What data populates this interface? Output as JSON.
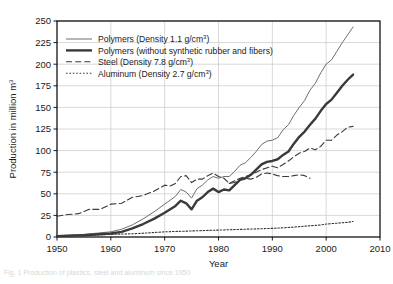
{
  "figure": {
    "caption": "Fig. 1  Production of plastics, steel and aluminum since 1950"
  },
  "chart_data": {
    "type": "line",
    "title": "",
    "xlabel": "Year",
    "ylabel": "Production in million m³",
    "xlim": [
      1950,
      2010
    ],
    "ylim": [
      0,
      250
    ],
    "xticks": [
      1950,
      1960,
      1970,
      1980,
      1990,
      2000,
      2010
    ],
    "yticks": [
      0,
      25,
      50,
      75,
      100,
      125,
      150,
      175,
      200,
      225,
      250
    ],
    "grid": "horizontal-and-vertical",
    "legend_position": "upper-left-inside",
    "series": [
      {
        "name": "Polymers (Density 1.1 g/cm³)",
        "style": "solid-thin",
        "color": "#6e6e6e",
        "width": 1.0,
        "points": [
          [
            1950,
            1.5
          ],
          [
            1955,
            3
          ],
          [
            1960,
            6
          ],
          [
            1962,
            9
          ],
          [
            1964,
            14
          ],
          [
            1966,
            21
          ],
          [
            1968,
            29
          ],
          [
            1970,
            38
          ],
          [
            1972,
            47
          ],
          [
            1973,
            55
          ],
          [
            1974,
            52
          ],
          [
            1975,
            45
          ],
          [
            1976,
            56
          ],
          [
            1977,
            60
          ],
          [
            1978,
            66
          ],
          [
            1979,
            70
          ],
          [
            1980,
            68
          ],
          [
            1981,
            70
          ],
          [
            1982,
            70
          ],
          [
            1983,
            76
          ],
          [
            1984,
            83
          ],
          [
            1985,
            86
          ],
          [
            1986,
            92
          ],
          [
            1987,
            99
          ],
          [
            1988,
            107
          ],
          [
            1989,
            111
          ],
          [
            1990,
            112
          ],
          [
            1991,
            115
          ],
          [
            1992,
            124
          ],
          [
            1993,
            130
          ],
          [
            1994,
            141
          ],
          [
            1995,
            150
          ],
          [
            1996,
            158
          ],
          [
            1997,
            170
          ],
          [
            1998,
            178
          ],
          [
            1999,
            190
          ],
          [
            2000,
            200
          ],
          [
            2001,
            205
          ],
          [
            2002,
            215
          ],
          [
            2003,
            225
          ],
          [
            2004,
            234
          ],
          [
            2005,
            243
          ]
        ]
      },
      {
        "name": "Polymers (without synthetic rubber and fibers)",
        "style": "solid-thick",
        "color": "#3a3a3a",
        "width": 2.4,
        "points": [
          [
            1950,
            1
          ],
          [
            1955,
            2
          ],
          [
            1960,
            4
          ],
          [
            1962,
            6
          ],
          [
            1964,
            10
          ],
          [
            1966,
            15
          ],
          [
            1968,
            21
          ],
          [
            1970,
            28
          ],
          [
            1972,
            36
          ],
          [
            1973,
            42
          ],
          [
            1974,
            39
          ],
          [
            1975,
            32
          ],
          [
            1976,
            42
          ],
          [
            1977,
            46
          ],
          [
            1978,
            52
          ],
          [
            1979,
            56
          ],
          [
            1980,
            52
          ],
          [
            1981,
            55
          ],
          [
            1982,
            54
          ],
          [
            1983,
            60
          ],
          [
            1984,
            66
          ],
          [
            1985,
            68
          ],
          [
            1986,
            72
          ],
          [
            1987,
            78
          ],
          [
            1988,
            84
          ],
          [
            1989,
            87
          ],
          [
            1990,
            88
          ],
          [
            1991,
            90
          ],
          [
            1992,
            95
          ],
          [
            1993,
            99
          ],
          [
            1994,
            108
          ],
          [
            1995,
            116
          ],
          [
            1996,
            122
          ],
          [
            1997,
            130
          ],
          [
            1998,
            137
          ],
          [
            1999,
            146
          ],
          [
            2000,
            154
          ],
          [
            2001,
            159
          ],
          [
            2002,
            167
          ],
          [
            2003,
            175
          ],
          [
            2004,
            182
          ],
          [
            2005,
            188
          ]
        ]
      },
      {
        "name": "Steel (Density 7.8 g/cm³)",
        "style": "dashed",
        "color": "#3a3a3a",
        "width": 1.1,
        "points": [
          [
            1950,
            24
          ],
          [
            1952,
            26
          ],
          [
            1954,
            27
          ],
          [
            1956,
            32
          ],
          [
            1958,
            32
          ],
          [
            1960,
            38
          ],
          [
            1962,
            39
          ],
          [
            1964,
            46
          ],
          [
            1966,
            48
          ],
          [
            1968,
            53
          ],
          [
            1970,
            60
          ],
          [
            1971,
            59
          ],
          [
            1972,
            62
          ],
          [
            1973,
            70
          ],
          [
            1974,
            71
          ],
          [
            1975,
            63
          ],
          [
            1976,
            67
          ],
          [
            1977,
            67
          ],
          [
            1978,
            71
          ],
          [
            1979,
            74
          ],
          [
            1980,
            70
          ],
          [
            1981,
            68
          ],
          [
            1982,
            62
          ],
          [
            1983,
            63
          ],
          [
            1984,
            67
          ],
          [
            1985,
            68
          ],
          [
            1986,
            67
          ],
          [
            1987,
            69
          ],
          [
            1988,
            73
          ],
          [
            1989,
            74
          ],
          [
            1990,
            73
          ],
          [
            1991,
            71
          ],
          [
            1992,
            70
          ],
          [
            1993,
            70
          ],
          [
            1994,
            71
          ],
          [
            1995,
            72
          ],
          [
            1996,
            71
          ],
          [
            1997,
            68
          ]
        ]
      },
      {
        "name": "Steel (Density 7.8 g/cm³)",
        "style": "dashed",
        "color": "#3a3a3a",
        "width": 1.1,
        "points": [
          [
            1982,
            62
          ],
          [
            1984,
            68
          ],
          [
            1986,
            72
          ],
          [
            1988,
            78
          ],
          [
            1990,
            82
          ],
          [
            1991,
            80
          ],
          [
            1992,
            84
          ],
          [
            1993,
            88
          ],
          [
            1994,
            93
          ],
          [
            1995,
            97
          ],
          [
            1996,
            99
          ],
          [
            1997,
            103
          ],
          [
            1998,
            101
          ],
          [
            1999,
            105
          ],
          [
            2000,
            112
          ],
          [
            2001,
            112
          ],
          [
            2002,
            118
          ],
          [
            2003,
            122
          ],
          [
            2004,
            127
          ],
          [
            2005,
            128
          ]
        ]
      },
      {
        "name": "Aluminum (Density 2.7 g/cm³)",
        "style": "dotted",
        "color": "#3a3a3a",
        "width": 1.1,
        "points": [
          [
            1950,
            1
          ],
          [
            1955,
            2
          ],
          [
            1960,
            3
          ],
          [
            1965,
            4
          ],
          [
            1970,
            6
          ],
          [
            1975,
            7
          ],
          [
            1980,
            8
          ],
          [
            1985,
            9
          ],
          [
            1990,
            10
          ],
          [
            1993,
            11
          ],
          [
            1995,
            12
          ],
          [
            1997,
            13
          ],
          [
            1999,
            14
          ],
          [
            2000,
            15
          ],
          [
            2002,
            16
          ],
          [
            2004,
            17
          ],
          [
            2005,
            18
          ]
        ]
      }
    ],
    "legend_entries": [
      {
        "label_main": "Polymers (Density 1.1 g/cm",
        "sup": "3",
        "label_tail": ")",
        "style": "solid-thin"
      },
      {
        "label_main": "Polymers (without synthetic rubber and fibers)",
        "sup": "",
        "label_tail": "",
        "style": "solid-thick"
      },
      {
        "label_main": "Steel (Density 7.8 g/cm",
        "sup": "3",
        "label_tail": ")",
        "style": "dashed"
      },
      {
        "label_main": "Aluminum (Density 2.7 g/cm",
        "sup": "3",
        "label_tail": ")",
        "style": "dotted"
      }
    ]
  }
}
